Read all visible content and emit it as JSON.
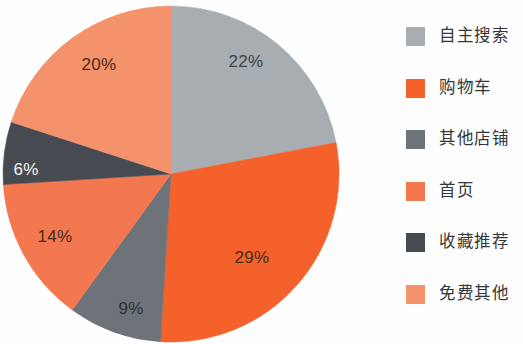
{
  "chart_data": {
    "type": "pie",
    "title": "",
    "subtitle": "",
    "xlabel": "",
    "ylabel": "",
    "grid": false,
    "legend_position": "right",
    "start_angle_deg": 0,
    "direction": "clockwise",
    "categories": [
      "自主搜索",
      "购物车",
      "其他店铺",
      "首页",
      "收藏推荐",
      "免费其他"
    ],
    "values": [
      22,
      29,
      9,
      14,
      6,
      20
    ],
    "value_labels": [
      "22%",
      "29%",
      "9%",
      "14%",
      "6%",
      "20%"
    ],
    "colors": [
      "#a8adb2",
      "#f4612a",
      "#6e7379",
      "#f3784f",
      "#464b52",
      "#f3926b"
    ],
    "slices": [
      {
        "name": "自主搜索",
        "value": 22,
        "label": "22%",
        "color": "#a8adb2",
        "start_deg": 0,
        "end_deg": 79.2,
        "label_x": 246,
        "label_y": 63,
        "label_color": "#3d4249"
      },
      {
        "name": "购物车",
        "value": 29,
        "label": "29%",
        "color": "#f4612a",
        "start_deg": 79.2,
        "end_deg": 183.6,
        "label_x": 252,
        "label_y": 259,
        "label_color": "#4a2a1c"
      },
      {
        "name": "其他店铺",
        "value": 9,
        "label": "9%",
        "color": "#6e7379",
        "start_deg": 183.6,
        "end_deg": 216.0,
        "label_x": 131,
        "label_y": 310,
        "label_color": "#2e3237"
      },
      {
        "name": "首页",
        "value": 14,
        "label": "14%",
        "color": "#f3784f",
        "start_deg": 216.0,
        "end_deg": 266.4,
        "label_x": 55,
        "label_y": 238,
        "label_color": "#4a2a1c"
      },
      {
        "name": "收藏推荐",
        "value": 6,
        "label": "6%",
        "color": "#464b52",
        "start_deg": 266.4,
        "end_deg": 288.0,
        "label_x": 26,
        "label_y": 171,
        "label_color": "#f2f2f2"
      },
      {
        "name": "免费其他",
        "value": 20,
        "label": "20%",
        "color": "#f3926b",
        "start_deg": 288.0,
        "end_deg": 360.0,
        "label_x": 99,
        "label_y": 66,
        "label_color": "#4a2a1c"
      }
    ]
  },
  "legend": {
    "items": [
      {
        "label": "自主搜索",
        "color": "#a8adb2"
      },
      {
        "label": "购物车",
        "color": "#f4612a"
      },
      {
        "label": "其他店铺",
        "color": "#6e7379"
      },
      {
        "label": "首页",
        "color": "#f3784f"
      },
      {
        "label": "收藏推荐",
        "color": "#464b52"
      },
      {
        "label": "免费其他",
        "color": "#f3926b"
      }
    ]
  }
}
